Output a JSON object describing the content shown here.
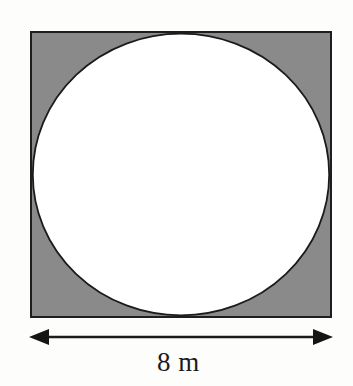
{
  "figure": {
    "background_color": "#fdfdfc",
    "square": {
      "name": "outer-square",
      "fill_color": "#8a8a8a",
      "stroke_color": "#1e1e1e",
      "stroke_width": 2,
      "x": 31,
      "y": 32,
      "width": 300,
      "height": 285,
      "side_length_value": 8,
      "side_length_units": "m"
    },
    "circle": {
      "name": "inscribed-circle",
      "fill_color": "#ffffff",
      "stroke_color": "#1b1b1b",
      "stroke_width": 1.7,
      "cx": 181,
      "cy": 174.5,
      "rx": 149,
      "ry": 141.5
    },
    "dimension": {
      "name": "width-dimension",
      "label": "8 m",
      "line_color": "#1b1b1b",
      "line_width": 2,
      "y": 337,
      "x_start": 31,
      "x_end": 331,
      "arrowhead_left": "left-arrowhead",
      "arrowhead_right": "right-arrowhead"
    }
  }
}
